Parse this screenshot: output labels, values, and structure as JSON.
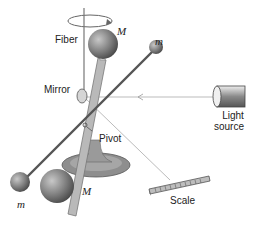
{
  "diagram": {
    "labels": {
      "fiber": "Fiber",
      "mirror": "Mirror",
      "pivot": "Pivot",
      "light_source_line1": "Light",
      "light_source_line2": "source",
      "scale": "Scale",
      "large_mass_top": "M",
      "large_mass_bottom": "M",
      "small_mass_top": "m",
      "small_mass_bottom": "m"
    },
    "colors": {
      "sphere": "#8a8a8a",
      "rod": "#3a3a3a",
      "stand": "#9a9a9a",
      "beam": "#aaaaaa"
    }
  }
}
